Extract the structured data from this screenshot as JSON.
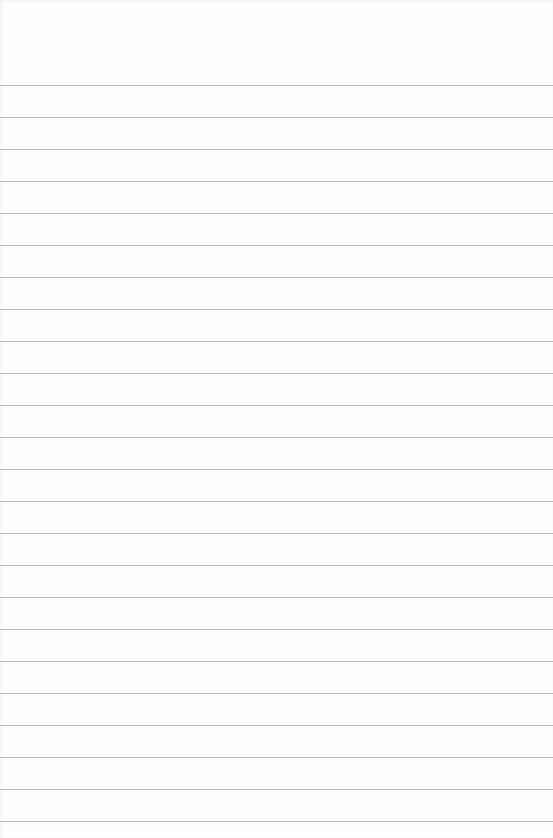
{
  "paper": {
    "background": "#fefefe",
    "rule_color": "#b9b9b9",
    "first_rule_y": 85,
    "rule_spacing": 32,
    "rule_count": 24
  }
}
